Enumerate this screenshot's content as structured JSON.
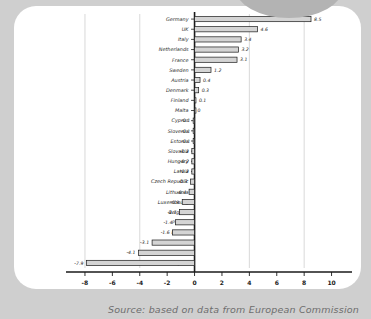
{
  "figure": {
    "caption": "Source: based on data from European Commission",
    "bubble_icon": "decorative-grey-bubble"
  },
  "chart_data": {
    "type": "bar",
    "orientation": "horizontal",
    "title": "",
    "xlabel": "",
    "ylabel": "",
    "xlim": [
      -8.8,
      11.2
    ],
    "xticks": [
      "-8",
      "-6",
      "-4",
      "-2",
      "0",
      "2",
      "4",
      "6",
      "8",
      "10"
    ],
    "xtick_values": [
      -8,
      -6,
      -4,
      -2,
      0,
      2,
      4,
      6,
      8,
      10
    ],
    "gridlines_x": [
      -8,
      -4,
      0,
      4,
      8
    ],
    "grid": true,
    "legend": "none",
    "bar_fill": "#d4d4d4",
    "bar_edge": "#1a1a1a",
    "axis_color": "#1a1a1a",
    "categories": [
      "Germany",
      "UK",
      "Italy",
      "Netherlands",
      "France",
      "Sweden",
      "Austria",
      "Denmark",
      "Finland",
      "Malta",
      "Cyprus",
      "Slovenia",
      "Estonia",
      "Slovakia",
      "Hungary",
      "Latvia",
      "Czech Republic",
      "Lithuania",
      "Luxembourg",
      "Belgium",
      "Poland",
      "Ireland",
      "Portugal",
      "Greece",
      "Spain"
    ],
    "values": [
      8.5,
      4.6,
      3.4,
      3.2,
      3.1,
      1.2,
      0.4,
      0.3,
      0.1,
      0,
      -0.1,
      -0.1,
      -0.1,
      -0.2,
      -0.2,
      -0.2,
      -0.3,
      -0.4,
      -0.9,
      -1.1,
      -1.4,
      -1.6,
      -3.1,
      -4.1,
      -7.9
    ],
    "value_labels": [
      "8.5",
      "4.6",
      "3.4",
      "3.2",
      "3.1",
      "1.2",
      "0.4",
      "0.3",
      "0.1",
      "0",
      "-0.1",
      "-0.1",
      "-0.1",
      "-0.2",
      "-0.2",
      "-0.2",
      "-0.3",
      "-0.4",
      "-0.9",
      "-1.1",
      "-1.4",
      "-1.6",
      "-3.1",
      "-4.1",
      "-7.9"
    ]
  }
}
